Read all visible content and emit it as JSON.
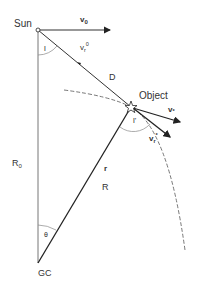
{
  "labels": {
    "sun": "Sun",
    "v0": "v",
    "v0_sub": "0",
    "vr0": "v",
    "vr0_sub": "r",
    "vr0_sup": "0",
    "angle_l": "l",
    "distance": "D",
    "object": "Object",
    "vstar": "v",
    "vstar_sub": "*",
    "angle_lp": "l'",
    "vrp": "v",
    "vrp_sub": "r",
    "vrp_sup": "*",
    "r0": "R",
    "r0_sub": "0",
    "r": "r",
    "R": "R",
    "theta": "θ",
    "gc": "GC"
  },
  "colors": {
    "line": "#222222",
    "thin_line": "#666666",
    "dashed": "#555555"
  }
}
